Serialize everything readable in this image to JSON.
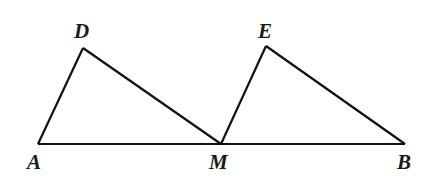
{
  "diagram": {
    "type": "geometry",
    "colors": {
      "stroke": "#111111",
      "label": "#1a1a1a",
      "background": "#ffffff"
    },
    "points": {
      "A": {
        "label": "A",
        "x": 38,
        "y": 144,
        "label_x": 27,
        "label_y": 169
      },
      "D": {
        "label": "D",
        "x": 83,
        "y": 48,
        "label_x": 74,
        "label_y": 38
      },
      "M": {
        "label": "M",
        "x": 221,
        "y": 144,
        "label_x": 209,
        "label_y": 169
      },
      "E": {
        "label": "E",
        "x": 266,
        "y": 46,
        "label_x": 258,
        "label_y": 38
      },
      "B": {
        "label": "B",
        "x": 405,
        "y": 144,
        "label_x": 397,
        "label_y": 169
      }
    },
    "segments": [
      {
        "name": "AB",
        "from": "A",
        "to": "B"
      },
      {
        "name": "AD",
        "from": "A",
        "to": "D"
      },
      {
        "name": "DM",
        "from": "D",
        "to": "M"
      },
      {
        "name": "ME",
        "from": "M",
        "to": "E"
      },
      {
        "name": "EB",
        "from": "E",
        "to": "B"
      }
    ],
    "triangles": [
      "ADM",
      "EMB"
    ]
  }
}
